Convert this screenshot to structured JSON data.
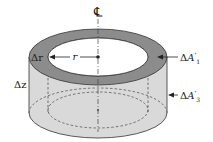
{
  "diagram": {
    "labels": {
      "centerline": "℄",
      "radius": "r",
      "delta_r": "Δr",
      "delta_z": "Δz",
      "area_top_delta": "Δ",
      "area_top_A": "A",
      "area_top_prime": "′",
      "area_top_sub": "1",
      "area_side_delta": "Δ",
      "area_side_A": "A",
      "area_side_prime": "′",
      "area_side_sub": "3"
    },
    "colors": {
      "ring_top": "#8c8c8c",
      "cylinder_side": "#d9d9d9",
      "outline": "#333333",
      "dashed": "#444444",
      "background": "#ffffff"
    }
  }
}
